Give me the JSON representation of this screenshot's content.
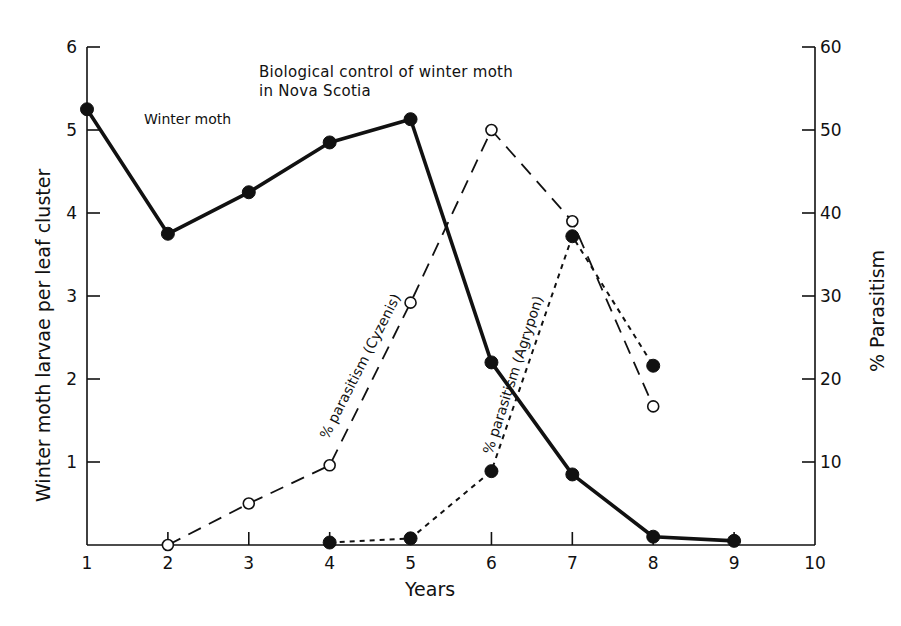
{
  "chart_data": {
    "type": "line",
    "title": "Biological control of winter moth in Nova Scotia",
    "title_lines": [
      "Biological control of winter moth",
      "in Nova Scotia"
    ],
    "xlabel": "Years",
    "ylabel": "Winter moth larvae per leaf cluster",
    "y2label": "% Parasitism",
    "xlim": [
      1,
      10
    ],
    "ylim": [
      0,
      6
    ],
    "y2lim": [
      0,
      60
    ],
    "x_ticks": [
      1,
      2,
      3,
      4,
      5,
      6,
      7,
      8,
      9,
      10
    ],
    "y_ticks": [
      1,
      2,
      3,
      4,
      5,
      6
    ],
    "y2_ticks": [
      10,
      20,
      30,
      40,
      50,
      60
    ],
    "grid": false,
    "legend": "none (series labelled inline)",
    "series": [
      {
        "name": "Winter moth",
        "axis": "left",
        "style": "solid",
        "marker": "filled-circle",
        "x": [
          1,
          2,
          3,
          4,
          5,
          6,
          7,
          8,
          9
        ],
        "values": [
          5.25,
          3.75,
          4.25,
          4.85,
          5.13,
          2.2,
          0.85,
          0.1,
          0.05
        ]
      },
      {
        "name": "% parasitism (Cyzenis)",
        "axis": "right",
        "style": "long-dash",
        "marker": "open-circle",
        "x": [
          2,
          3,
          4,
          5,
          6,
          7,
          8
        ],
        "values": [
          0,
          5,
          9.6,
          29.2,
          50,
          39,
          16.7
        ]
      },
      {
        "name": "% parasitism (Agrypon)",
        "axis": "right",
        "style": "short-dash",
        "marker": "filled-circle",
        "x": [
          4,
          5,
          6,
          7,
          8
        ],
        "values": [
          0.3,
          0.8,
          8.9,
          37.2,
          21.6
        ]
      }
    ],
    "annotations": [
      {
        "text": "Winter moth",
        "x": 1.7,
        "y": 5.1
      },
      {
        "text": "% parasitism (Cyzenis)",
        "rotated": true
      },
      {
        "text": "% parasitism (Agrypon)",
        "rotated": true
      }
    ]
  }
}
